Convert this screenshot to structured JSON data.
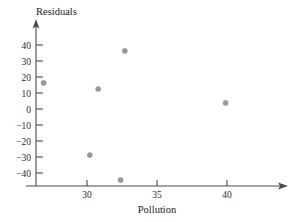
{
  "chart_data": {
    "type": "scatter",
    "title": "",
    "xlabel": "Pollution",
    "ylabel": "Residuals",
    "xlim": [
      25.3,
      42.0
    ],
    "ylim": [
      -47,
      46
    ],
    "xticks": [
      30,
      35,
      40
    ],
    "xtick_labels": [
      "30",
      "35",
      "40"
    ],
    "yticks": [
      40,
      30,
      20,
      10,
      0,
      -10,
      -20,
      -30,
      -40
    ],
    "ytick_labels": [
      "40",
      "30",
      "20",
      "10",
      "0",
      "−10",
      "−20",
      "−30",
      "−40"
    ],
    "grid": false,
    "legend": null,
    "point_color": "#9a9a9a",
    "axis_color": "#4a4a4a",
    "points": [
      {
        "x": 26.9,
        "y": 16.3
      },
      {
        "x": 30.8,
        "y": 12.5
      },
      {
        "x": 32.7,
        "y": 36.3
      },
      {
        "x": 30.2,
        "y": -28.8
      },
      {
        "x": 32.4,
        "y": -44.4
      },
      {
        "x": 39.9,
        "y": 3.8
      }
    ]
  },
  "labels": {
    "y_axis_title": "Residuals",
    "x_axis_title": "Pollution"
  }
}
